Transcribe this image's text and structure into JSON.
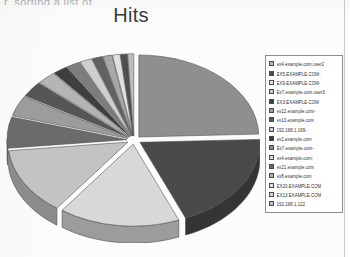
{
  "page": {
    "cropped_header_text": "r. sorting a list of"
  },
  "chart_data": {
    "type": "pie",
    "title": "Hits",
    "style": "3d-exploded-grayscale",
    "xlabel": "",
    "ylabel": "",
    "legend_position": "right",
    "grid": false,
    "categories": [
      "ex4.example.com.user2",
      "EX5.EXAMPLE.COM-",
      "EX9.EXAMPLE.COM-",
      "Ex7.example.com.user3",
      "EX3.EXAMPLE.COM",
      "ex12.example.com-",
      "ex10.example.com",
      "192.168.1.169-",
      "ex2.example.com",
      "Ex7.example.com-",
      "ex4.example.com-",
      "ex21.example.com",
      "ex8.example.com",
      "EX20.EXAMPLE.COM",
      "EX13.EXAMPLE.COM",
      "192.168.1.122"
    ],
    "values": [
      24,
      19,
      16,
      13,
      6,
      4,
      3,
      2.5,
      2,
      1.8,
      1.6,
      1.4,
      1.2,
      1.0,
      0.9,
      0.8
    ],
    "colors": [
      "#8f8f8f",
      "#4a4a4a",
      "#d8d8d8",
      "#c3c3c3",
      "#6b6b6b",
      "#9c9c9c",
      "#565656",
      "#b5b5b5",
      "#3f3f3f",
      "#7d7d7d",
      "#cfcfcf",
      "#616161",
      "#a8a8a8",
      "#e0e0e0",
      "#4f4f4f",
      "#bdbdbd"
    ],
    "legend_swatch_colors": [
      "#b8b8b8",
      "#4a4a4a",
      "#e2e2e2",
      "#c8c8c8",
      "#3f3f3f",
      "#a0a0a0",
      "#5a5a5a",
      "#cccccc",
      "#3a3a3a",
      "#8a8a8a",
      "#dcdcdc",
      "#6a6a6a",
      "#b0b0b0",
      "#e4e4e4",
      "#d6d6d6",
      "#c0c0c0"
    ]
  }
}
